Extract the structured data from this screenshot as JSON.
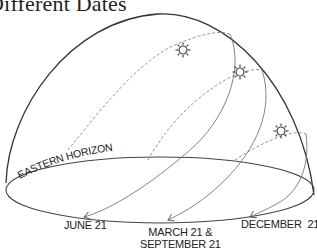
{
  "title": "Different Dates",
  "horizon_label": "EASTERN HORIZON",
  "dates": [
    {
      "label": "JUNE 21"
    },
    {
      "label_line1": "MARCH 21 &",
      "label_line2": "SEPTEMBER 21"
    },
    {
      "label": "DECEMBER  21"
    }
  ],
  "icons": [
    "sun-icon",
    "sun-icon",
    "sun-icon"
  ],
  "colors": {
    "dome_outline": "#333333",
    "path_solid": "#777777",
    "path_dashed": "#888888",
    "text": "#222222"
  }
}
